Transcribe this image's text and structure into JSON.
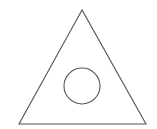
{
  "diagram": {
    "width": 157,
    "height": 129,
    "background": "#ffffff",
    "stroke_color": "#555555",
    "stroke_width": 1.1,
    "shapes": {
      "triangle": {
        "type": "triangle",
        "points": [
          [
            82,
            10
          ],
          [
            19,
            124
          ],
          [
            146,
            124
          ]
        ]
      },
      "circle": {
        "type": "circle",
        "cx": 82,
        "cy": 86,
        "r": 18
      }
    }
  }
}
